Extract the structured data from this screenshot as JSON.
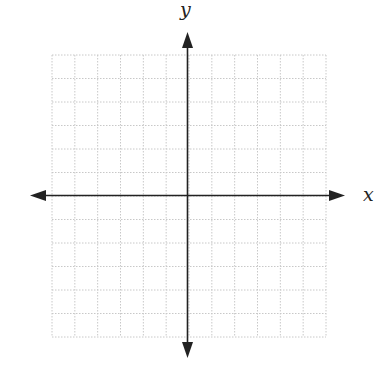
{
  "diagram": {
    "type": "cartesian-coordinate-plane",
    "x_axis_label": "x",
    "y_axis_label": "y",
    "grid": {
      "columns": 12,
      "rows": 12,
      "x_range": [
        -6,
        6
      ],
      "y_range": [
        -6,
        6
      ],
      "line_style": "dotted",
      "line_color": "#c8c8c8"
    },
    "axis_color": "#222222",
    "background": "#ffffff"
  },
  "chart_data": {
    "type": "scatter",
    "title": "",
    "xlabel": "x",
    "ylabel": "y",
    "xlim": [
      -6,
      6
    ],
    "ylim": [
      -6,
      6
    ],
    "grid": true,
    "series": []
  }
}
